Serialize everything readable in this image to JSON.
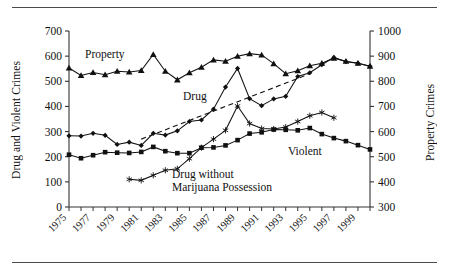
{
  "figure": {
    "left_axis_title": "Drug and Violent Crimes",
    "right_axis_title": "Property Crimes"
  },
  "chart_data": {
    "type": "line",
    "title": "",
    "xlabel": "",
    "ylabel": "Drug and Violent Crimes",
    "y2label": "Property Crimes",
    "grid": false,
    "legend": "inline-annotations",
    "xlim": [
      1975,
      2000
    ],
    "ylim": [
      0,
      700
    ],
    "y2lim": [
      300,
      1000
    ],
    "yticks": [
      0,
      100,
      200,
      300,
      400,
      500,
      600,
      700
    ],
    "y2ticks": [
      300,
      400,
      500,
      600,
      700,
      800,
      900,
      1000
    ],
    "xticks": [
      1975,
      1977,
      1979,
      1981,
      1983,
      1985,
      1987,
      1989,
      1991,
      1993,
      1995,
      1997,
      1999
    ],
    "xtick_labels": [
      "1975",
      "1977",
      "1979",
      "1981",
      "1983",
      "1985",
      "1987",
      "1989",
      "1991",
      "1993",
      "1995",
      "1997",
      "1999"
    ],
    "x": [
      1975,
      1976,
      1977,
      1978,
      1979,
      1980,
      1981,
      1982,
      1983,
      1984,
      1985,
      1986,
      1987,
      1988,
      1989,
      1990,
      1991,
      1992,
      1993,
      1994,
      1995,
      1996,
      1997,
      1998,
      1999,
      2000
    ],
    "series": [
      {
        "name": "Property",
        "axis": "right",
        "marker": "triangle",
        "line": "solid",
        "label": "Property",
        "values": [
          853,
          823,
          835,
          826,
          840,
          837,
          843,
          907,
          840,
          806,
          834,
          856,
          885,
          880,
          900,
          910,
          905,
          870,
          830,
          842,
          862,
          872,
          892,
          880,
          872,
          860
        ]
      },
      {
        "name": "Drug",
        "axis": "left",
        "marker": "diamond",
        "line": "solid",
        "label": "Drug",
        "values": [
          283,
          282,
          293,
          285,
          249,
          258,
          245,
          293,
          286,
          303,
          340,
          346,
          389,
          477,
          551,
          431,
          403,
          430,
          440,
          519,
          534,
          566,
          595,
          578,
          572,
          560
        ]
      },
      {
        "name": "Violent",
        "axis": "left",
        "marker": "square",
        "line": "solid",
        "label": "Violent",
        "values": [
          208,
          194,
          206,
          218,
          216,
          215,
          219,
          239,
          222,
          214,
          214,
          236,
          237,
          245,
          266,
          292,
          297,
          308,
          307,
          305,
          314,
          290,
          274,
          262,
          246,
          229
        ]
      },
      {
        "name": "Drug without Marijuana Possession",
        "axis": "left",
        "marker": "star",
        "line": "solid",
        "label": "Drug without\nMarijuana Possession",
        "x_start": 1980,
        "values": [
          null,
          null,
          null,
          null,
          null,
          110,
          106,
          126,
          146,
          152,
          192,
          236,
          270,
          305,
          402,
          332,
          312,
          310,
          318,
          340,
          363,
          376,
          355,
          null,
          null,
          null
        ]
      },
      {
        "name": "Trend",
        "axis": "left",
        "marker": "none",
        "line": "dashed",
        "label": "",
        "x_start": 1981,
        "x_end": 1995,
        "values": [
          null,
          null,
          null,
          null,
          null,
          null,
          270,
          null,
          null,
          null,
          null,
          null,
          null,
          null,
          null,
          null,
          null,
          null,
          null,
          null,
          530,
          null,
          null,
          null,
          null,
          null
        ]
      }
    ],
    "annotations": [
      {
        "text": "Property",
        "x": 1978,
        "y": 600,
        "name": "property-label"
      },
      {
        "text": "Drug",
        "x": 1986,
        "y": 455,
        "name": "drug-label"
      },
      {
        "text": "Violent",
        "x": 1995,
        "y": 230,
        "name": "violent-label"
      },
      {
        "text": "Drug without",
        "x": 1986,
        "y": 145,
        "name": "dwmp-label-line1"
      },
      {
        "text": "Marijuana Possession",
        "x": 1986,
        "y": 120,
        "name": "dwmp-label-line2"
      }
    ]
  }
}
